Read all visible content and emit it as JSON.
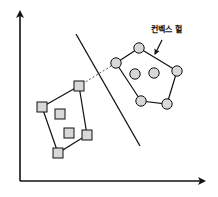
{
  "diagram": {
    "title": "",
    "label": "컨벡스 헐",
    "colors": {
      "stroke": "#111111",
      "fill": "#d8d8d8",
      "background": "#ffffff"
    },
    "axes": {
      "origin": [
        20,
        181
      ],
      "y_top": [
        20,
        12
      ],
      "x_right": [
        204,
        181
      ]
    },
    "separator_line": {
      "from": [
        76,
        34
      ],
      "to": [
        140,
        146
      ]
    },
    "class_a_squares": {
      "shape": "square",
      "hull": [
        [
          79,
          86
        ],
        [
          42,
          107
        ],
        [
          58,
          153
        ],
        [
          87,
          135
        ]
      ],
      "interior": [
        [
          60,
          114
        ],
        [
          69,
          133
        ]
      ]
    },
    "class_b_circles": {
      "shape": "circle",
      "hull": [
        [
          116,
          63
        ],
        [
          139,
          48
        ],
        [
          177,
          71
        ],
        [
          167,
          104
        ],
        [
          141,
          101
        ]
      ],
      "interior": [
        [
          135,
          74
        ],
        [
          154,
          73
        ]
      ]
    },
    "support_dashed_line": {
      "from": [
        79,
        86
      ],
      "to": [
        116,
        63
      ]
    },
    "label_arrow": {
      "from": [
        162,
        40
      ],
      "to": [
        155,
        54
      ]
    },
    "label_position": [
      151,
      32
    ]
  }
}
